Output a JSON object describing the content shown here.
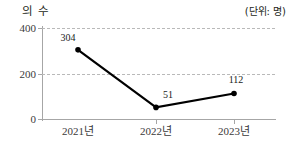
{
  "header": {
    "title": "의 수",
    "unit_label": "(단위: 명)"
  },
  "chart_data": {
    "type": "line",
    "title": "의 수",
    "unit": "(단위: 명)",
    "categories": [
      "2021년",
      "2022년",
      "2023년"
    ],
    "values": [
      304,
      51,
      112
    ],
    "data_labels": [
      "304",
      "51",
      "112"
    ],
    "xlabel": "",
    "ylabel": "",
    "ylim": [
      0,
      400
    ],
    "yticks": [
      0,
      200,
      400
    ],
    "ytick_labels": [
      "0",
      "200",
      "400"
    ],
    "grid": true,
    "gridlines_at": [
      200,
      400
    ],
    "legend": null,
    "series_color": "#000000",
    "marker": "dot",
    "axis_color": "#a6a6a6",
    "grid_color": "#b9b9b9"
  }
}
